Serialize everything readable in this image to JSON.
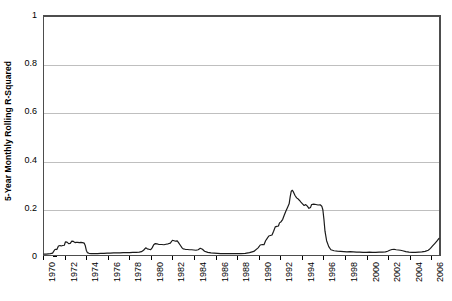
{
  "chart_data": {
    "type": "line",
    "title": "",
    "xlabel": "",
    "ylabel": "5-Year Monthly Rolling R-Squared",
    "xlim": [
      1970,
      2006.9
    ],
    "ylim": [
      0,
      1
    ],
    "grid": true,
    "legend": null,
    "y_ticks": [
      0,
      0.2,
      0.4,
      0.6,
      0.8,
      1
    ],
    "y_tick_labels": [
      "0",
      "0.2",
      "0.4",
      "0.6",
      "0.8",
      "1"
    ],
    "x_ticks": [
      1970,
      1972,
      1974,
      1976,
      1978,
      1980,
      1982,
      1984,
      1986,
      1988,
      1990,
      1992,
      1994,
      1996,
      1998,
      2000,
      2002,
      2004,
      2006
    ],
    "x_tick_labels": [
      "1970",
      "1972",
      "1974",
      "1976",
      "1978",
      "1980",
      "1982",
      "1984",
      "1986",
      "1988",
      "1990",
      "1992",
      "1994",
      "1996",
      "1998",
      "2000",
      "2002",
      "2004",
      "2006"
    ],
    "series_color": "#1a1a1a",
    "series": [
      {
        "name": "5-Year Monthly Rolling R-Squared",
        "x": [
          1970.0,
          1970.2,
          1970.4,
          1970.6,
          1970.8,
          1971.0,
          1971.1,
          1971.2,
          1971.35,
          1971.5,
          1971.6,
          1971.75,
          1971.9,
          1972.0,
          1972.15,
          1972.3,
          1972.45,
          1972.6,
          1972.75,
          1972.9,
          1973.0,
          1973.15,
          1973.3,
          1973.45,
          1973.6,
          1973.75,
          1973.85,
          1973.95,
          1974.05,
          1974.2,
          1974.4,
          1974.6,
          1974.8,
          1975.0,
          1975.3,
          1975.6,
          1975.9,
          1976.2,
          1976.5,
          1976.8,
          1977.1,
          1977.4,
          1977.7,
          1978.0,
          1978.3,
          1978.6,
          1978.9,
          1979.1,
          1979.3,
          1979.5,
          1979.65,
          1979.8,
          1979.95,
          1980.1,
          1980.25,
          1980.4,
          1980.55,
          1980.7,
          1980.85,
          1981.0,
          1981.2,
          1981.4,
          1981.6,
          1981.8,
          1982.0,
          1982.15,
          1982.3,
          1982.45,
          1982.6,
          1982.75,
          1982.9,
          1983.0,
          1983.2,
          1983.4,
          1983.6,
          1983.8,
          1984.0,
          1984.2,
          1984.4,
          1984.6,
          1984.8,
          1985.0,
          1985.3,
          1985.6,
          1985.9,
          1986.2,
          1986.5,
          1986.8,
          1987.1,
          1987.4,
          1987.7,
          1988.0,
          1988.4,
          1988.8,
          1989.2,
          1989.6,
          1990.0,
          1990.2,
          1990.4,
          1990.55,
          1990.7,
          1990.85,
          1991.0,
          1991.15,
          1991.3,
          1991.45,
          1991.6,
          1991.75,
          1991.9,
          1992.0,
          1992.15,
          1992.3,
          1992.45,
          1992.6,
          1992.75,
          1992.9,
          1993.0,
          1993.1,
          1993.2,
          1993.3,
          1993.45,
          1993.6,
          1993.75,
          1993.9,
          1994.0,
          1994.15,
          1994.3,
          1994.45,
          1994.6,
          1994.75,
          1994.9,
          1995.0,
          1995.2,
          1995.4,
          1995.6,
          1995.8,
          1995.95,
          1996.05,
          1996.15,
          1996.25,
          1996.4,
          1996.6,
          1996.8,
          1997.1,
          1997.4,
          1997.7,
          1998.0,
          1998.3,
          1998.6,
          1998.9,
          1999.2,
          1999.5,
          1999.8,
          2000.1,
          2000.4,
          2000.7,
          2001.0,
          2001.3,
          2001.6,
          2001.9,
          2002.1,
          2002.3,
          2002.5,
          2002.7,
          2002.9,
          2003.1,
          2003.3,
          2003.5,
          2003.8,
          2004.1,
          2004.4,
          2004.7,
          2005.0,
          2005.3,
          2005.6,
          2005.9,
          2006.1,
          2006.3,
          2006.5,
          2006.7,
          2006.9
        ],
        "y": [
          0.004,
          0.004,
          0.005,
          0.006,
          0.008,
          0.022,
          0.024,
          0.023,
          0.038,
          0.04,
          0.038,
          0.04,
          0.041,
          0.055,
          0.054,
          0.048,
          0.049,
          0.058,
          0.057,
          0.052,
          0.053,
          0.053,
          0.052,
          0.053,
          0.052,
          0.05,
          0.04,
          0.02,
          0.01,
          0.007,
          0.006,
          0.006,
          0.006,
          0.006,
          0.007,
          0.007,
          0.008,
          0.008,
          0.009,
          0.009,
          0.009,
          0.01,
          0.01,
          0.01,
          0.011,
          0.011,
          0.012,
          0.014,
          0.02,
          0.03,
          0.026,
          0.024,
          0.022,
          0.03,
          0.043,
          0.048,
          0.047,
          0.045,
          0.044,
          0.044,
          0.043,
          0.045,
          0.047,
          0.05,
          0.062,
          0.06,
          0.058,
          0.059,
          0.05,
          0.04,
          0.03,
          0.026,
          0.024,
          0.023,
          0.022,
          0.022,
          0.021,
          0.02,
          0.022,
          0.028,
          0.024,
          0.016,
          0.011,
          0.009,
          0.008,
          0.007,
          0.006,
          0.006,
          0.006,
          0.006,
          0.006,
          0.006,
          0.006,
          0.007,
          0.01,
          0.015,
          0.03,
          0.042,
          0.044,
          0.043,
          0.06,
          0.07,
          0.08,
          0.082,
          0.084,
          0.1,
          0.118,
          0.12,
          0.122,
          0.135,
          0.14,
          0.15,
          0.168,
          0.185,
          0.2,
          0.215,
          0.245,
          0.268,
          0.272,
          0.265,
          0.25,
          0.24,
          0.235,
          0.228,
          0.222,
          0.215,
          0.208,
          0.212,
          0.205,
          0.196,
          0.2,
          0.212,
          0.214,
          0.212,
          0.21,
          0.211,
          0.205,
          0.19,
          0.15,
          0.1,
          0.06,
          0.035,
          0.022,
          0.018,
          0.016,
          0.015,
          0.014,
          0.013,
          0.014,
          0.013,
          0.012,
          0.012,
          0.011,
          0.011,
          0.012,
          0.011,
          0.011,
          0.012,
          0.012,
          0.013,
          0.016,
          0.02,
          0.023,
          0.024,
          0.022,
          0.021,
          0.02,
          0.018,
          0.014,
          0.012,
          0.011,
          0.011,
          0.012,
          0.013,
          0.015,
          0.02,
          0.028,
          0.038,
          0.048,
          0.058,
          0.07
        ]
      }
    ]
  }
}
